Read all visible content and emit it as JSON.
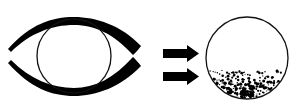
{
  "figure": {
    "title": "Eye with clear lens transforming into lens with scattered particulate sediment",
    "background_color": "#ffffff",
    "ink_color": "#000000",
    "outline_color": "#111111",
    "width": 300,
    "height": 112,
    "panels": [
      {
        "id": "left-panel",
        "name": "eye-before",
        "label": "Eye outline with clear round lens",
        "center_x": 74,
        "center_y": 56
      },
      {
        "id": "arrows",
        "name": "transition-arrows",
        "label": "Two stacked rightward arrows",
        "count": 2
      },
      {
        "id": "right-panel",
        "name": "lens-after",
        "label": "Round lens with dense particle sediment settled in lower portion",
        "center_x": 247,
        "center_y": 58
      }
    ]
  },
  "eye": {
    "name": "eye-shape",
    "upper_lid": {
      "label": "upper eyelid arc",
      "tip_left_x": 8,
      "tip_right_x": 141,
      "apex_y": 18,
      "max_thickness": 7
    },
    "lower_lid": {
      "label": "lower eyelid arc",
      "tip_left_x": 8,
      "tip_right_x": 141,
      "apex_y": 95,
      "max_thickness": 7
    },
    "iris": {
      "label": "iris circle",
      "center_x": 74,
      "center_y": 56,
      "radius": 37,
      "stroke_width": 1.3,
      "fill": "none"
    }
  },
  "arrows": {
    "name": "double-arrow-group",
    "color": "#000000",
    "items": [
      {
        "name": "arrow-top",
        "x": 163,
        "y": 45,
        "length": 36,
        "shaft_height": 8,
        "head_width": 12,
        "head_height": 17
      },
      {
        "name": "arrow-bottom",
        "x": 163,
        "y": 68,
        "length": 36,
        "shaft_height": 8,
        "head_width": 12,
        "head_height": 17
      }
    ]
  },
  "result_lens": {
    "name": "sediment-lens",
    "center_x": 247,
    "center_y": 58,
    "radius": 41,
    "stroke_width": 1.3,
    "fill": "none",
    "sediment": {
      "label": "particulate sediment layer",
      "top_y": 70,
      "bottom_y": 99,
      "particle_count": 236,
      "particle_color": "#000000",
      "min_radius": 0.5,
      "max_radius": 2.1,
      "density_description": "dense at bottom, sparse near top"
    }
  }
}
